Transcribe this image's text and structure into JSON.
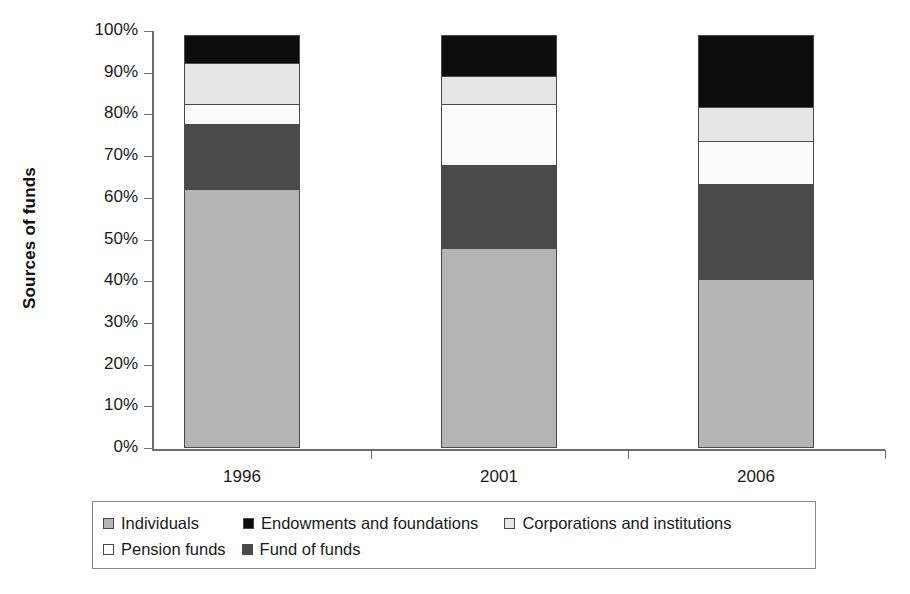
{
  "chart_data": {
    "type": "bar",
    "subtype": "stacked-percent",
    "title": "",
    "xlabel": "",
    "ylabel": "Sources of funds",
    "categories": [
      "1996",
      "2001",
      "2006"
    ],
    "ylim": [
      0,
      100
    ],
    "ytick_labels": [
      "0%",
      "10%",
      "20%",
      "30%",
      "40%",
      "50%",
      "60%",
      "70%",
      "80%",
      "90%",
      "100%"
    ],
    "ytick_values": [
      0,
      10,
      20,
      30,
      40,
      50,
      60,
      70,
      80,
      90,
      100
    ],
    "grid": false,
    "legend_position": "bottom",
    "stack_order_bottom_to_top": [
      "Individuals",
      "Fund of funds",
      "Pension funds",
      "Corporations and institutions",
      "Endowments and foundations"
    ],
    "series": [
      {
        "name": "Individuals",
        "color": "#b4b4b4",
        "values": [
          62,
          48,
          40.5
        ]
      },
      {
        "name": "Fund of funds",
        "color": "#4a4a4a",
        "values": [
          16,
          20,
          23
        ]
      },
      {
        "name": "Pension funds",
        "color": "#fbfbfb",
        "values": [
          5,
          15,
          10.5
        ]
      },
      {
        "name": "Corporations and institutions",
        "color": "#e6e6e6",
        "values": [
          10,
          7,
          8.5
        ]
      },
      {
        "name": "Endowments and foundations",
        "color": "#0d0d0d",
        "values": [
          7,
          10,
          17.5
        ]
      }
    ]
  },
  "legend": {
    "entries": [
      {
        "label": "Individuals",
        "color": "#b4b4b4"
      },
      {
        "label": "Endowments and foundations",
        "color": "#0d0d0d"
      },
      {
        "label": "Corporations and institutions",
        "color": "#e6e6e6"
      },
      {
        "label": "Pension funds",
        "color": "#fbfbfb"
      },
      {
        "label": "Fund of funds",
        "color": "#4a4a4a"
      }
    ]
  },
  "axis": {
    "y_title": "Sources of funds",
    "axis_color": "#6e6e6e",
    "segment_border_color": "#4a4a4a"
  }
}
